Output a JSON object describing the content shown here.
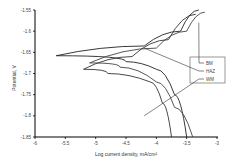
{
  "chart_data": {
    "type": "line",
    "title": "",
    "xlabel": "Log current density, mA/cm²",
    "ylabel": "Potential, V",
    "xlim": [
      -6,
      -3
    ],
    "ylim": [
      -1.85,
      -1.55
    ],
    "xticks": [
      "-6",
      "-5.5",
      "-5",
      "-4.5",
      "-4",
      "-3.5",
      "-3"
    ],
    "yticks": [
      "-1.55",
      "-1.6",
      "-1.65",
      "-1.7",
      "-1.75",
      "-1.8",
      "-1.85"
    ],
    "grid": false,
    "legend_position": "right-inside",
    "series": [
      {
        "name": "BM",
        "points": [
          [
            -3.3,
            -1.55
          ],
          [
            -3.6,
            -1.6
          ],
          [
            -4.2,
            -1.635
          ],
          [
            -5.65,
            -1.658
          ],
          [
            -4.5,
            -1.672
          ],
          [
            -4.0,
            -1.69
          ],
          [
            -3.7,
            -1.75
          ],
          [
            -3.5,
            -1.85
          ]
        ]
      },
      {
        "name": "HAZ",
        "points": [
          [
            -3.2,
            -1.555
          ],
          [
            -3.5,
            -1.6
          ],
          [
            -4.0,
            -1.64
          ],
          [
            -5.1,
            -1.675
          ],
          [
            -4.6,
            -1.685
          ],
          [
            -4.0,
            -1.72
          ],
          [
            -3.7,
            -1.78
          ],
          [
            -3.4,
            -1.85
          ]
        ]
      },
      {
        "name": "WM",
        "points": [
          [
            -3.35,
            -1.56
          ],
          [
            -3.8,
            -1.62
          ],
          [
            -4.4,
            -1.66
          ],
          [
            -5.2,
            -1.69
          ],
          [
            -4.8,
            -1.7
          ],
          [
            -4.1,
            -1.72
          ],
          [
            -3.9,
            -1.77
          ],
          [
            -3.75,
            -1.85
          ]
        ]
      }
    ]
  },
  "legend": {
    "items": [
      "BM",
      "HAZ",
      "WM"
    ]
  }
}
